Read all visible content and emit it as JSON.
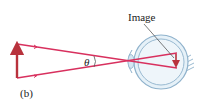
{
  "figure": {
    "panel_label": "(b)",
    "angle_label": "θ",
    "image_label": "Image"
  },
  "colors": {
    "ray": "#d8305e",
    "object_arrow": "#b8323c",
    "eye_stroke": "#8fb2cc",
    "eye_fill": "#e6f1f8",
    "eye_inner": "#d5e7f3",
    "leader": "#444444",
    "text": "#222222"
  }
}
